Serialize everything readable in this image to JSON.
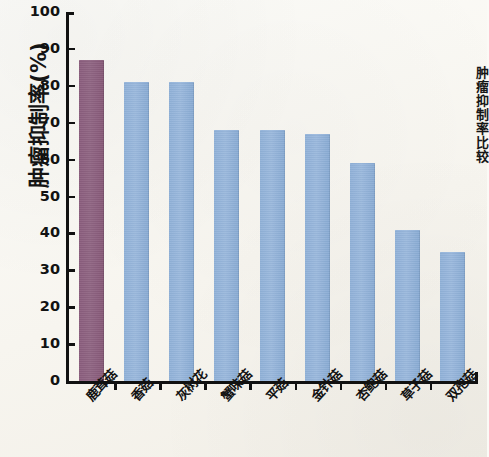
{
  "chart_data": {
    "type": "bar",
    "title": "",
    "xlabel": "",
    "ylabel": "肿瘤抑制率(%)",
    "ylim": [
      0,
      100
    ],
    "ytick_values": [
      100,
      90,
      80,
      70,
      60,
      50,
      40,
      30,
      20,
      10,
      0
    ],
    "ytick_labels": [
      "100",
      "90",
      "80",
      "70",
      "60",
      "50",
      "40",
      "30",
      "20",
      "10",
      "0"
    ],
    "grid": false,
    "legend": "none",
    "categories": [
      "鹿茸菇",
      "香菇",
      "灰树花",
      "蟹味菇",
      "平菇",
      "金针菇",
      "杏鲍菇",
      "草子菇",
      "双孢菇"
    ],
    "values": [
      87,
      81,
      81,
      68,
      68,
      67,
      59,
      41,
      35
    ],
    "colors": [
      "#8d6183",
      "#92b0d6",
      "#92b0d6",
      "#92b0d6",
      "#92b0d6",
      "#92b0d6",
      "#92b0d6",
      "#92b0d6",
      "#92b0d6"
    ],
    "highlight_color": "#8d6183",
    "series_color": "#92b0d6",
    "axis_color": "#111111"
  },
  "side_caption": "肿瘤抑制率比较",
  "bars": [
    {
      "label": "鹿茸菇",
      "value": 87,
      "kind": "primary"
    },
    {
      "label": "香菇",
      "value": 81,
      "kind": "secondary"
    },
    {
      "label": "灰树花",
      "value": 81,
      "kind": "secondary"
    },
    {
      "label": "蟹味菇",
      "value": 68,
      "kind": "secondary"
    },
    {
      "label": "平菇",
      "value": 68,
      "kind": "secondary"
    },
    {
      "label": "金针菇",
      "value": 67,
      "kind": "secondary"
    },
    {
      "label": "杏鲍菇",
      "value": 59,
      "kind": "secondary"
    },
    {
      "label": "草子菇",
      "value": 41,
      "kind": "secondary"
    },
    {
      "label": "双孢菇",
      "value": 35,
      "kind": "secondary"
    }
  ]
}
